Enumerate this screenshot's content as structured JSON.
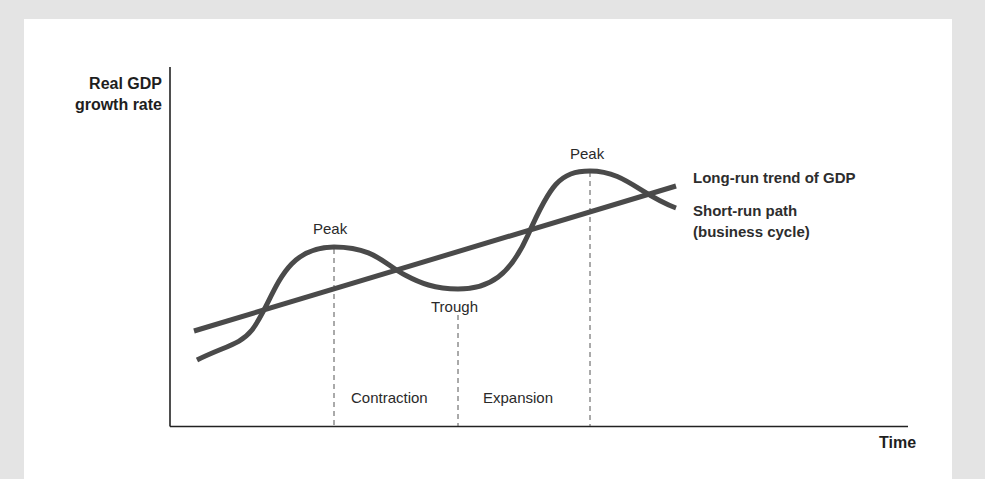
{
  "axes": {
    "y_label_line1": "Real GDP",
    "y_label_line2": "growth rate",
    "x_label": "Time"
  },
  "annotations": {
    "peak1": "Peak",
    "trough": "Trough",
    "peak2": "Peak",
    "contraction": "Contraction",
    "expansion": "Expansion"
  },
  "legend": {
    "trend": "Long-run trend of GDP",
    "cycle_line1": "Short-run path",
    "cycle_line2": "(business cycle)"
  },
  "colors": {
    "line": "#4a4a4a",
    "axis": "#222222",
    "background": "#e4e4e4",
    "panel": "#ffffff"
  }
}
